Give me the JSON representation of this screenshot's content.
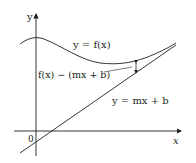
{
  "diagram": {
    "axes": {
      "x_label": "x",
      "y_label": "y",
      "origin_label": "0"
    },
    "curves": {
      "function_label": "y = f(x)",
      "line_label": "y = mx + b",
      "difference_label": "f(x) − (mx + b)"
    },
    "colors": {
      "stroke": "#231f20",
      "background": "#ffffff"
    }
  }
}
